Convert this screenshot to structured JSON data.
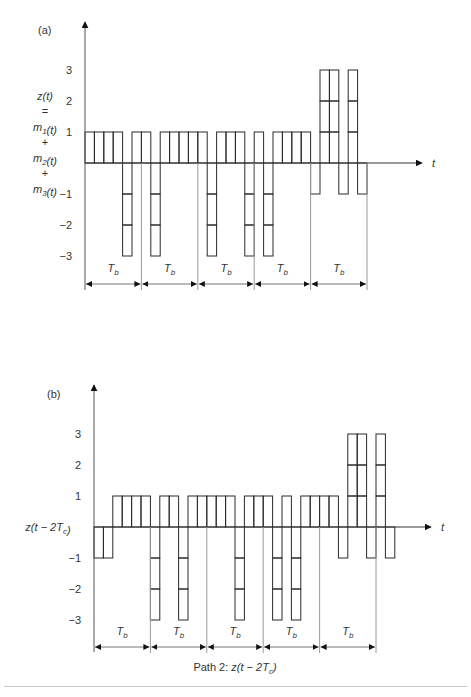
{
  "figure": {
    "colors": {
      "stroke": "#2a2a2a",
      "guide": "#9a9a9a",
      "text": "#333333"
    },
    "chip_width": 9.4,
    "panels": [
      {
        "id": "a",
        "label": "(a)",
        "y_label_lines": [
          "z(t)",
          "=",
          "m1(t)",
          "+",
          "m2(t)",
          "+",
          "m3(t)"
        ],
        "x_axis_label": "t",
        "origin_x": 85,
        "zero_y": 163,
        "unit_y": 31,
        "axis_top_y": 22,
        "axis_bottom_y": 290,
        "axis_end_x": 422,
        "y_ticks": [
          "3",
          "2",
          "1",
          "-1",
          "-2",
          "-3"
        ],
        "y_tick_values": [
          3,
          2,
          1,
          -1,
          -2,
          -3
        ],
        "chips": [
          1,
          1,
          1,
          1,
          -3,
          1,
          1,
          -3,
          1,
          1,
          1,
          1,
          1,
          -3,
          1,
          1,
          1,
          -3,
          1,
          -3,
          1,
          1,
          1,
          1,
          -1,
          3,
          3,
          -1,
          3,
          -1
        ],
        "bit_period_label": "Tb",
        "bit_boundaries_chips": [
          0,
          6,
          12,
          18,
          24,
          30
        ],
        "dimension_y": 284,
        "caption": ""
      },
      {
        "id": "b",
        "label": "(b)",
        "y_label_lines": [
          "z(t − 2Tc)"
        ],
        "x_axis_label": "t",
        "origin_x": 94,
        "zero_y": 527,
        "unit_y": 31,
        "axis_top_y": 385,
        "axis_bottom_y": 652,
        "axis_end_x": 431,
        "y_ticks": [
          "3",
          "2",
          "1",
          "-1",
          "-2",
          "-3"
        ],
        "y_tick_values": [
          3,
          2,
          1,
          -1,
          -2,
          -3
        ],
        "chips": [
          -1,
          -1,
          1,
          1,
          1,
          1,
          -3,
          1,
          1,
          -3,
          1,
          1,
          1,
          1,
          1,
          -3,
          1,
          1,
          1,
          -3,
          1,
          -3,
          1,
          1,
          1,
          1,
          -1,
          3,
          3,
          -1,
          3,
          -1
        ],
        "bit_period_label": "Tb",
        "bit_boundaries_chips": [
          0,
          6,
          12,
          18,
          24,
          30
        ],
        "dimension_y": 647,
        "caption": "Path 2: z(t − 2Tc)"
      }
    ]
  }
}
